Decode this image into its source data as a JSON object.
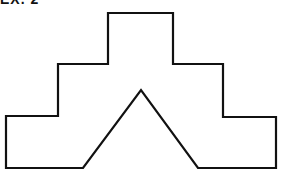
{
  "caption": "EX. 2",
  "figure": {
    "stroke_color": "#111111",
    "fill_color": "#ffffff",
    "points": "108,13 173,13 173,64 223,64 223,117 276,117 276,168 198,168 141,90 83,168 6,168 6,116 58,116 58,64 108,64"
  }
}
